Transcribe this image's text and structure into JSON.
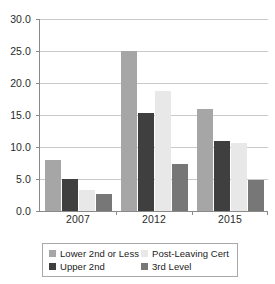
{
  "chart_data": {
    "type": "bar",
    "title": "",
    "subtitle": "",
    "xlabel": "",
    "ylabel": "",
    "categories": [
      "2007",
      "2012",
      "2015"
    ],
    "series": [
      {
        "name": "Lower 2nd or Less",
        "color": "#a6a6a6",
        "values": [
          8.0,
          25.0,
          16.0
        ]
      },
      {
        "name": "Upper 2nd",
        "color": "#3f3f3f",
        "values": [
          5.0,
          15.3,
          10.9
        ]
      },
      {
        "name": "Post-Leaving Cert",
        "color": "#e8e8e8",
        "values": [
          3.3,
          18.8,
          10.7
        ]
      },
      {
        "name": "3rd Level",
        "color": "#777777",
        "values": [
          2.6,
          7.4,
          4.8
        ]
      }
    ],
    "ylim": [
      0.0,
      30.0
    ],
    "ytick_step": 5.0,
    "ytick_labels": [
      "30.0",
      "25.0",
      "20.0",
      "15.0",
      "10.0",
      "5.0",
      "0.0"
    ],
    "grid": true,
    "legend_position": "bottom"
  },
  "legend": {
    "items": [
      {
        "label": "Lower 2nd or Less",
        "color": "#a6a6a6"
      },
      {
        "label": "Post-Leaving Cert",
        "color": "#e8e8e8"
      },
      {
        "label": "Upper 2nd",
        "color": "#3f3f3f"
      },
      {
        "label": "3rd Level",
        "color": "#777777"
      }
    ]
  },
  "colors": {
    "axis": "#8a8a8a",
    "gridline": "#c9c9c9",
    "text": "#2b2b2b",
    "background": "#ffffff",
    "legend_border": "#a8a8a8"
  }
}
